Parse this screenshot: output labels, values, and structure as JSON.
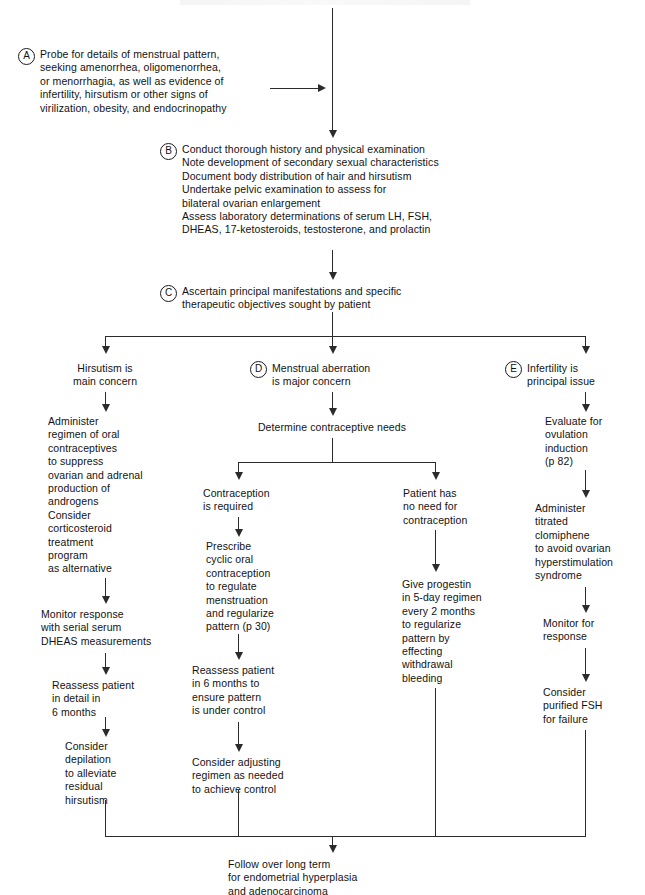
{
  "diagram": {
    "type": "clinical-decision-flowchart",
    "nodes": {
      "a": {
        "marker": "A",
        "text": "Probe for details of menstrual pattern,\nseeking amenorrhea, oligomenorrhea,\nor menorrhagia, as well as evidence of\ninfertility, hirsutism or other signs of\nvirilization, obesity, and endocrinopathy"
      },
      "b": {
        "marker": "B",
        "text": "Conduct thorough history and physical examination\nNote development of secondary sexual characteristics\nDocument body distribution of hair and hirsutism\nUndertake pelvic examination to assess for\n   bilateral ovarian enlargement\nAssess laboratory determinations of serum LH, FSH,\n   DHEAS, 17-ketosteroids, testosterone, and prolactin"
      },
      "c": {
        "marker": "C",
        "text": "Ascertain principal manifestations and specific\ntherapeutic objectives sought by patient"
      },
      "branch_hirsutism": {
        "marker": "",
        "text": "Hirsutism is\nmain concern"
      },
      "branch_menstrual": {
        "marker": "D",
        "text": "Menstrual aberration\nis major concern"
      },
      "branch_infertility": {
        "marker": "E",
        "text": "Infertility is\nprincipal issue"
      },
      "l1": {
        "text": "Administer\n   regimen of oral\n   contraceptives\n   to suppress\n   ovarian and adrenal\n   production of\n   androgens\nConsider\n   corticosteroid\n   treatment\n   program\n   as alternative"
      },
      "l2": {
        "text": "Monitor response\nwith serial serum\nDHEAS measurements"
      },
      "l3": {
        "text": "Reassess patient\nin detail in\n6 months"
      },
      "l4": {
        "text": "Consider\ndepilation\nto alleviate\nresidual\nhirsutism"
      },
      "m0": {
        "text": "Determine contraceptive needs"
      },
      "m1": {
        "text": "Contraception\nis required"
      },
      "m2": {
        "text": "Prescribe\ncyclic oral\ncontraception\nto regulate\nmenstruation\nand regularize\npattern (p 30)"
      },
      "m3": {
        "text": "Reassess patient\nin 6 months to\nensure pattern\nis under control"
      },
      "m4": {
        "text": "Consider adjusting\nregimen as needed\nto achieve control"
      },
      "n1": {
        "text": "Patient has\nno need for\ncontraception"
      },
      "n2": {
        "text": "Give progestin\nin 5-day regimen\nevery 2 months\nto regularize\npattern by\neffecting\nwithdrawal\nbleeding"
      },
      "r1": {
        "text": "Evaluate for\novulation\ninduction\n(p 82)"
      },
      "r2": {
        "text": "Administer\ntitrated\nclomiphene\nto avoid ovarian\nhyperstimulation\nsyndrome"
      },
      "r3": {
        "text": "Monitor for\nresponse"
      },
      "r4": {
        "text": "Consider\npurified FSH\nfor failure"
      },
      "end": {
        "text": "Follow over long term\nfor endometrial hyperplasia\nand adenocarcinoma"
      }
    },
    "colors": {
      "ink": "#121212",
      "line": "#2b2b2b",
      "background": "#ffffff"
    }
  }
}
